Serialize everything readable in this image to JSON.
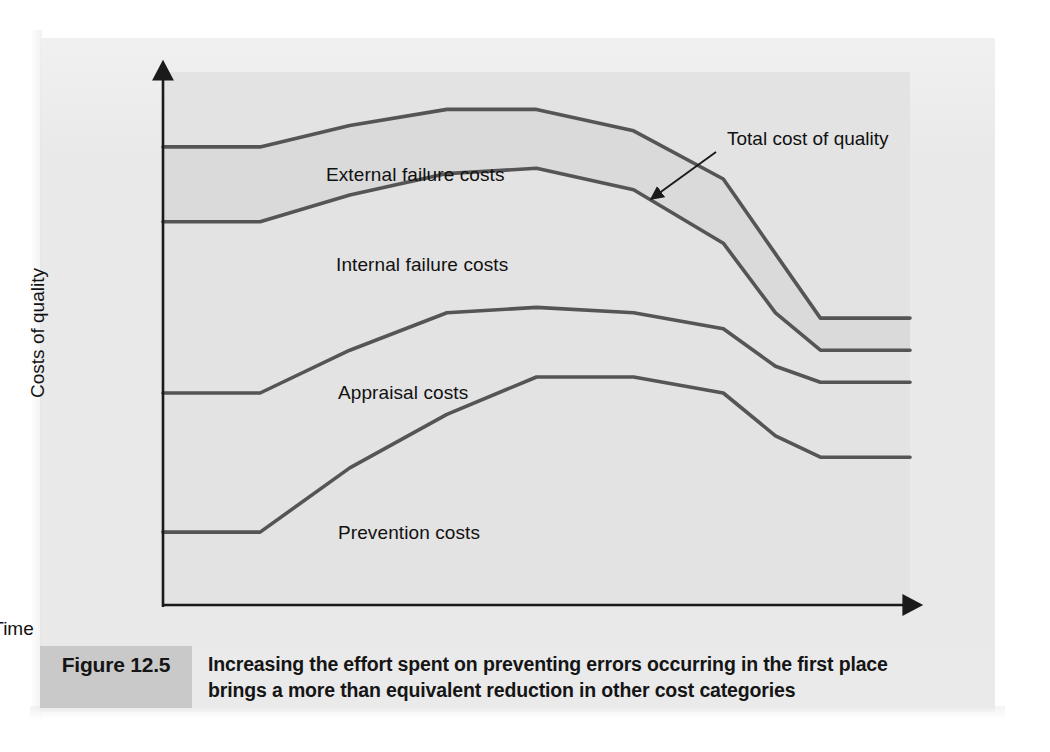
{
  "figure": {
    "caption_number": "Figure 12.5",
    "caption_lines": [
      "Increasing the effort spent on preventing errors occurring in the first place",
      "brings a more than equivalent reduction in other cost categories"
    ]
  },
  "colors": {
    "page_background": "#e9e9e9",
    "plot_background": "#e3e3e3",
    "band_top_fill": "#d8d8d8",
    "curve_stroke": "#555555",
    "axis_stroke": "#1a1a1a",
    "caption_number_background": "#c9c9c9",
    "caption_text_background": "#eaeaea",
    "text": "#111111"
  },
  "chart_data": {
    "type": "area",
    "title": "",
    "subtitle": "",
    "xlabel": "Time",
    "ylabel": "Costs of quality",
    "grid": false,
    "legend_position": "inline-band-labels",
    "axis_arrows": {
      "x": true,
      "y": true
    },
    "x_tick_labels": [],
    "y_tick_labels": [],
    "xlim": [
      0,
      100
    ],
    "ylim": [
      0,
      100
    ],
    "annotations": [
      {
        "text": "Total cost of quality",
        "points_to": "top boundary curve (total cost of quality)",
        "label_x": 78,
        "label_y": 90,
        "arrow_tip_x": 65,
        "arrow_tip_y": 77
      }
    ],
    "note": "Stacked cumulative cost bands over time. Values are percentages of the plot height; each series gives the cumulative upper boundary of that band.",
    "x": [
      0,
      13,
      25,
      38,
      50,
      63,
      75,
      82,
      88,
      100
    ],
    "series": [
      {
        "name": "Prevention costs",
        "label": "Prevention costs",
        "cumulative_upper": [
          14,
          14,
          26,
          36,
          43,
          43,
          40,
          32,
          28,
          28
        ],
        "band_label_x": 33,
        "band_label_y": 18
      },
      {
        "name": "Appraisal costs",
        "label": "Appraisal costs",
        "cumulative_upper": [
          40,
          40,
          48,
          55,
          56,
          55,
          52,
          45,
          42,
          42
        ],
        "band_label_x": 33,
        "band_label_y": 44
      },
      {
        "name": "Internal failure costs",
        "label": "Internal failure costs",
        "cumulative_upper": [
          72,
          72,
          77,
          81,
          82,
          78,
          68,
          55,
          48,
          48
        ],
        "band_label_x": 33,
        "band_label_y": 68
      },
      {
        "name": "External failure costs",
        "label": "External failure costs",
        "cumulative_upper": [
          86,
          86,
          90,
          93,
          93,
          89,
          80,
          66,
          54,
          54
        ],
        "band_label_x": 33,
        "band_label_y": 85
      }
    ],
    "total_series": {
      "name": "Total cost of quality",
      "description": "Topmost boundary of the stack equals total cost of quality"
    }
  }
}
